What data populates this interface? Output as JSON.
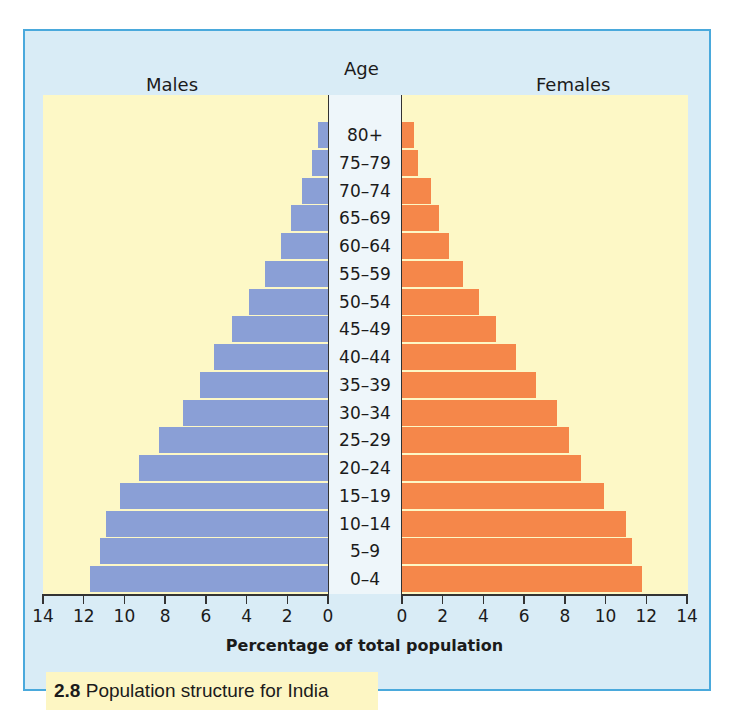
{
  "figure": {
    "number": "2.8",
    "caption": "Population structure for India"
  },
  "headers": {
    "left": "Males",
    "center": "Age",
    "right": "Females"
  },
  "axis": {
    "xlabel": "Percentage of total population",
    "left_ticks": [
      "14",
      "12",
      "10",
      "8",
      "6",
      "4",
      "2",
      "0"
    ],
    "right_ticks": [
      "0",
      "2",
      "4",
      "6",
      "8",
      "10",
      "12",
      "14"
    ]
  },
  "colors": {
    "males": "#8a9fd6",
    "females": "#f5874a",
    "plot_background": "#fdf8c6",
    "frame_background": "#d9ecf6",
    "frame_border": "#4aa9dc"
  },
  "chart_data": {
    "type": "bar",
    "subtype": "population-pyramid",
    "title": "Population structure for India",
    "figure_number": "2.8",
    "xlabel": "Percentage of total population",
    "ylabel": "Age",
    "xlim": [
      0,
      14
    ],
    "x_ticks": [
      0,
      2,
      4,
      6,
      8,
      10,
      12,
      14
    ],
    "categories": [
      "80+",
      "75–79",
      "70–74",
      "65–69",
      "60–64",
      "55–59",
      "50–54",
      "45–49",
      "40–44",
      "35–39",
      "30–34",
      "25–29",
      "20–24",
      "15–19",
      "10–14",
      "5–9",
      "0–4"
    ],
    "series": [
      {
        "name": "Males",
        "side": "left",
        "color": "#8a9fd6",
        "values": [
          0.5,
          0.8,
          1.3,
          1.8,
          2.3,
          3.1,
          3.9,
          4.7,
          5.6,
          6.3,
          7.1,
          8.3,
          9.3,
          10.2,
          10.9,
          11.2,
          11.7
        ]
      },
      {
        "name": "Females",
        "side": "right",
        "color": "#f5874a",
        "values": [
          0.6,
          0.8,
          1.4,
          1.8,
          2.3,
          3.0,
          3.8,
          4.6,
          5.6,
          6.6,
          7.6,
          8.2,
          8.8,
          9.9,
          11.0,
          11.3,
          11.8
        ]
      }
    ],
    "grid": false,
    "legend": "headers above each side (Males left, Females right)"
  }
}
